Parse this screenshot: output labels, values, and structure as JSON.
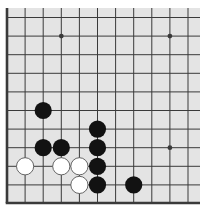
{
  "board": {
    "description": "Go board corner diagram (lower-left corner)",
    "columns": 11,
    "rows": 11,
    "edges": [
      "left",
      "bottom"
    ],
    "colors": {
      "background": "#e4e4e4",
      "line": "#3a3a3a",
      "black_stone": "#121212",
      "white_stone": "#ffffff",
      "white_outline": "#555555"
    },
    "star_points": [
      {
        "col": 3,
        "row": 1
      },
      {
        "col": 9,
        "row": 1
      },
      {
        "col": 9,
        "row": 7
      }
    ],
    "stones": [
      {
        "color": "black",
        "col": 2,
        "row": 5
      },
      {
        "color": "black",
        "col": 5,
        "row": 6
      },
      {
        "color": "black",
        "col": 2,
        "row": 7
      },
      {
        "color": "black",
        "col": 3,
        "row": 7
      },
      {
        "color": "black",
        "col": 5,
        "row": 7
      },
      {
        "color": "white",
        "col": 1,
        "row": 8
      },
      {
        "color": "white",
        "col": 3,
        "row": 8
      },
      {
        "color": "white",
        "col": 4,
        "row": 8
      },
      {
        "color": "black",
        "col": 5,
        "row": 8
      },
      {
        "color": "white",
        "col": 4,
        "row": 9
      },
      {
        "color": "black",
        "col": 5,
        "row": 9
      },
      {
        "color": "black",
        "col": 7,
        "row": 9
      }
    ]
  }
}
